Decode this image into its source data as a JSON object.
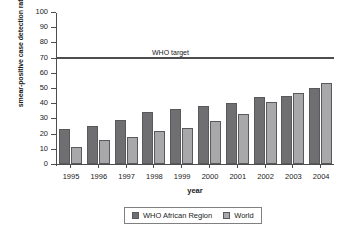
{
  "chart_data": {
    "type": "bar",
    "title": "",
    "xlabel": "year",
    "ylabel": "smear-positive case detection rate",
    "categories": [
      "1995",
      "1996",
      "1997",
      "1998",
      "1999",
      "2000",
      "2001",
      "2002",
      "2003",
      "2004"
    ],
    "series": [
      {
        "name": "WHO African Region",
        "color": "#6f6f71",
        "values": [
          23,
          25,
          29,
          34,
          36,
          38,
          40,
          44,
          45,
          50
        ]
      },
      {
        "name": "World",
        "color": "#a8a8aa",
        "values": [
          11,
          16,
          18,
          22,
          24,
          28,
          33,
          41,
          47,
          53
        ]
      }
    ],
    "ylim": [
      0,
      100
    ],
    "yticks": [
      0,
      10,
      20,
      30,
      40,
      50,
      60,
      70,
      80,
      90,
      100
    ],
    "grid": false,
    "legend_position": "bottom-center",
    "annotations": [
      {
        "name": "who-target",
        "label": "WHO target",
        "value": 70,
        "orientation": "horizontal"
      }
    ]
  },
  "legend": {
    "items": [
      {
        "label": "WHO African Region"
      },
      {
        "label": "World"
      }
    ]
  }
}
